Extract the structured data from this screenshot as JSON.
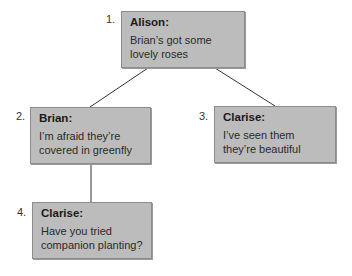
{
  "diagram": {
    "type": "conversation-tree",
    "nodes": [
      {
        "id": 1,
        "number": "1.",
        "speaker": "Alison:",
        "line1": "Brian’s got some",
        "line2": "lovely roses",
        "parent": null
      },
      {
        "id": 2,
        "number": "2.",
        "speaker": "Brian:",
        "line1": "I’m afraid they’re",
        "line2": "covered in greenfly",
        "parent": 1
      },
      {
        "id": 3,
        "number": "3.",
        "speaker": "Clarise:",
        "line1": "I’ve seen them",
        "line2": "they’re beautiful",
        "parent": 1
      },
      {
        "id": 4,
        "number": "4.",
        "speaker": "Clarise:",
        "line1": "Have you tried",
        "line2": "companion planting?",
        "parent": 2
      }
    ],
    "colors": {
      "box_fill": "#bcbcbc",
      "box_border": "#8c8c8c",
      "connector": "#333333"
    }
  }
}
